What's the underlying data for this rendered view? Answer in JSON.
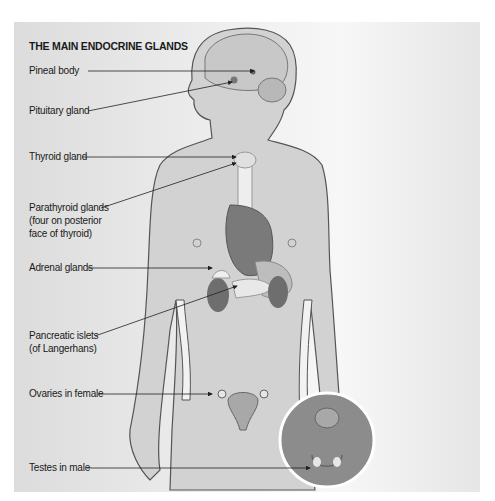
{
  "diagram": {
    "title": "THE MAIN ENDOCRINE GLANDS",
    "labels": [
      {
        "id": "pineal",
        "text": "Pineal body"
      },
      {
        "id": "pituitary",
        "text": "Pituitary gland"
      },
      {
        "id": "thyroid",
        "text": "Thyroid gland"
      },
      {
        "id": "parathyroid",
        "lines": [
          "Parathyroid glands",
          "(four on posterior",
          "face of thyroid)"
        ]
      },
      {
        "id": "adrenal",
        "text": "Adrenal glands"
      },
      {
        "id": "pancreatic",
        "lines": [
          "Pancreatic islets",
          "(of Langerhans)"
        ]
      },
      {
        "id": "ovaries",
        "text": "Ovaries in female"
      },
      {
        "id": "testes",
        "text": "Testes in male"
      }
    ],
    "colors": {
      "body_fill": "#d2d2d2",
      "outline": "#555555",
      "organ_dark": "#707070",
      "organ_light": "#e8e8e8",
      "inset_circle": "#8c8c8c",
      "leader_line": "#222222"
    }
  }
}
